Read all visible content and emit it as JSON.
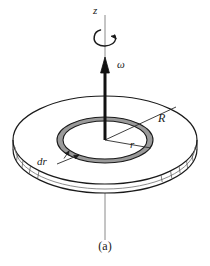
{
  "figure": {
    "caption": "(a)",
    "labels": {
      "axis": "z",
      "angular_velocity": "ω",
      "outer_radius": "R",
      "ring_radius": "r",
      "ring_width": "dr"
    },
    "colors": {
      "line": "#1a1a1a",
      "axis_line": "#7a7a7a",
      "ring_fill": "#9a9a9a",
      "disk_fill": "#ffffff",
      "background": "#ffffff"
    },
    "geometry": {
      "center_x": 105,
      "center_y": 140,
      "outer_rx": 92,
      "outer_ry": 44,
      "disk_thickness": 9,
      "ring_outer_rx": 48,
      "ring_outer_ry": 23,
      "ring_inner_rx": 42,
      "ring_inner_ry": 19,
      "axis_top_y": 15,
      "axis_bottom_y": 240,
      "vector_tip_y": 58
    }
  }
}
